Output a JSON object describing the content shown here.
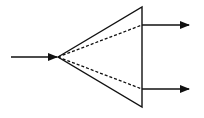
{
  "diagram": {
    "colors": {
      "stroke": "#111111",
      "background": "#ffffff"
    },
    "input_arrow": {
      "x1": 11,
      "y1": 57,
      "x2": 57,
      "y2": 57
    },
    "apex": {
      "x": 58,
      "y": 57
    },
    "triangle": {
      "points": [
        [
          58,
          57
        ],
        [
          142,
          7
        ],
        [
          142,
          107
        ]
      ]
    },
    "dashed_paths": [
      {
        "x1": 58,
        "y1": 57,
        "x2": 142,
        "y2": 25
      },
      {
        "x1": 58,
        "y1": 57,
        "x2": 142,
        "y2": 89
      }
    ],
    "output_arrows": [
      {
        "x1": 142,
        "y1": 25,
        "x2": 189,
        "y2": 25
      },
      {
        "x1": 142,
        "y1": 89,
        "x2": 189,
        "y2": 89
      }
    ]
  }
}
